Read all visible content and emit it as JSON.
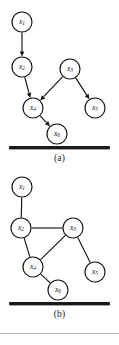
{
  "figure": {
    "panels": [
      {
        "id": "a",
        "caption": "(a)",
        "graph_type": "directed",
        "nodes": [
          {
            "id": "x1",
            "label_base": "x",
            "label_sub": "1",
            "cx": 22,
            "cy": 22,
            "r": 10
          },
          {
            "id": "x2",
            "label_base": "x",
            "label_sub": "2",
            "cx": 22,
            "cy": 67,
            "r": 10
          },
          {
            "id": "x3",
            "label_base": "x",
            "label_sub": "3",
            "cx": 70,
            "cy": 69,
            "r": 10
          },
          {
            "id": "x4",
            "label_base": "x",
            "label_sub": "4",
            "cx": 33,
            "cy": 108,
            "r": 10
          },
          {
            "id": "x5",
            "label_base": "x",
            "label_sub": "5",
            "cx": 95,
            "cy": 108,
            "r": 10
          },
          {
            "id": "x6",
            "label_base": "x",
            "label_sub": "6",
            "cx": 57,
            "cy": 134,
            "r": 10
          }
        ],
        "edges": [
          {
            "from": "x1",
            "to": "x2",
            "directed": true
          },
          {
            "from": "x2",
            "to": "x4",
            "directed": true
          },
          {
            "from": "x3",
            "to": "x4",
            "directed": true
          },
          {
            "from": "x3",
            "to": "x5",
            "directed": true
          },
          {
            "from": "x4",
            "to": "x6",
            "directed": true
          }
        ]
      },
      {
        "id": "b",
        "caption": "(b)",
        "graph_type": "undirected",
        "nodes": [
          {
            "id": "x1",
            "label_base": "x",
            "label_sub": "1",
            "cx": 22,
            "cy": 15,
            "r": 10
          },
          {
            "id": "x2",
            "label_base": "x",
            "label_sub": "2",
            "cx": 21,
            "cy": 56,
            "r": 10
          },
          {
            "id": "x3",
            "label_base": "x",
            "label_sub": "3",
            "cx": 73,
            "cy": 56,
            "r": 10
          },
          {
            "id": "x4",
            "label_base": "x",
            "label_sub": "4",
            "cx": 33,
            "cy": 95,
            "r": 10
          },
          {
            "id": "x5",
            "label_base": "x",
            "label_sub": "5",
            "cx": 95,
            "cy": 100,
            "r": 10
          },
          {
            "id": "x6",
            "label_base": "x",
            "label_sub": "6",
            "cx": 58,
            "cy": 118,
            "r": 10
          }
        ],
        "edges": [
          {
            "from": "x1",
            "to": "x2",
            "directed": false
          },
          {
            "from": "x2",
            "to": "x3",
            "directed": false
          },
          {
            "from": "x2",
            "to": "x4",
            "directed": false
          },
          {
            "from": "x3",
            "to": "x4",
            "directed": false
          },
          {
            "from": "x3",
            "to": "x5",
            "directed": false
          },
          {
            "from": "x4",
            "to": "x6",
            "directed": false
          }
        ]
      }
    ],
    "colors": {
      "ink": "#141414",
      "background": "#ffffff",
      "bar": "#1a1a1a",
      "rule": "#b4b4b4"
    }
  }
}
